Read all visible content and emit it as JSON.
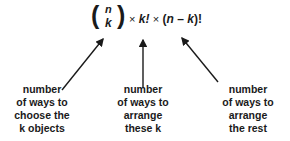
{
  "formula": {
    "binomial_top": "n",
    "binomial_bottom": "k",
    "open_paren": "(",
    "close_paren": ")",
    "times1": "×",
    "term1": "k!",
    "times2": "×",
    "term2_open": "(",
    "term2_n": "n",
    "term2_minus": " – ",
    "term2_k": "k",
    "term2_close": ")!"
  },
  "labels": [
    {
      "lines": [
        "number",
        "of ways to",
        "choose the",
        "k objects"
      ]
    },
    {
      "lines": [
        "number",
        "of ways to",
        "arrange",
        "these k"
      ]
    },
    {
      "lines": [
        "number",
        "of ways to",
        "arrange",
        "the rest"
      ]
    }
  ],
  "colors": {
    "text": "#1a1a1a",
    "arrow": "#1a1a1a",
    "background": "#ffffff"
  }
}
